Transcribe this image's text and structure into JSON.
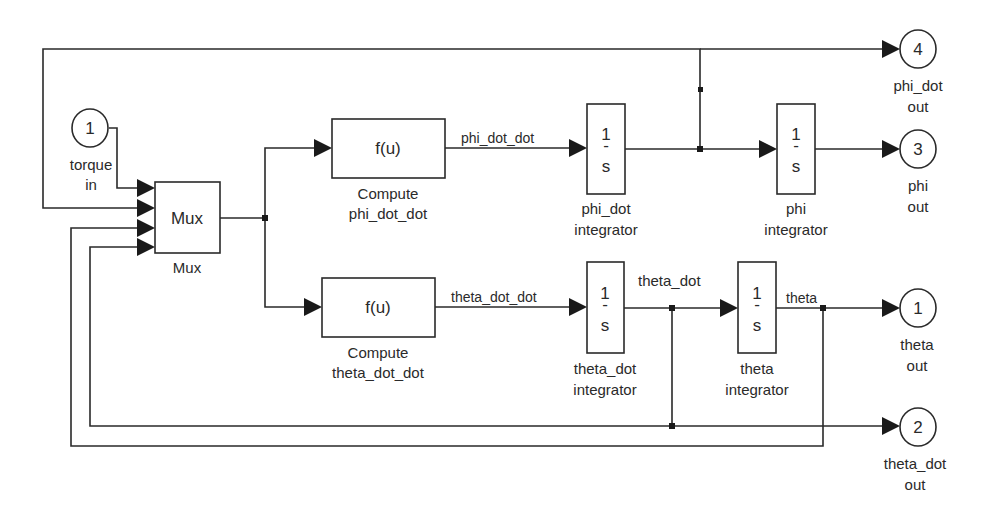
{
  "diagram": {
    "type": "simulink-block-diagram",
    "inports": [
      {
        "number": "1",
        "name_line1": "torque",
        "name_line2": "in"
      }
    ],
    "mux": {
      "label": "Mux",
      "name": "Mux",
      "inputs": 4
    },
    "fcn_blocks": {
      "phi": {
        "expr": "f(u)",
        "name_line1": "Compute",
        "name_line2": "phi_dot_dot"
      },
      "theta": {
        "expr": "f(u)",
        "name_line1": "Compute",
        "name_line2": "theta_dot_dot"
      }
    },
    "integrators": {
      "phi_dot": {
        "num": "1",
        "bar": "-",
        "den": "s",
        "name_line1": "phi_dot",
        "name_line2": "integrator"
      },
      "phi": {
        "num": "1",
        "bar": "-",
        "den": "s",
        "name_line1": "phi",
        "name_line2": "integrator"
      },
      "theta_dot": {
        "num": "1",
        "bar": "-",
        "den": "s",
        "name_line1": "theta_dot",
        "name_line2": "integrator"
      },
      "theta": {
        "num": "1",
        "bar": "-",
        "den": "s",
        "name_line1": "theta",
        "name_line2": "integrator"
      }
    },
    "signals": {
      "phi_dot_dot": "phi_dot_dot",
      "theta_dot_dot": "theta_dot_dot",
      "theta_dot": "theta_dot",
      "theta": "theta"
    },
    "outports": {
      "phi_dot": {
        "number": "4",
        "name_line1": "phi_dot",
        "name_line2": "out"
      },
      "phi": {
        "number": "3",
        "name_line1": "phi",
        "name_line2": "out"
      },
      "theta": {
        "number": "1",
        "name_line1": "theta",
        "name_line2": "out"
      },
      "theta_dot": {
        "number": "2",
        "name_line1": "theta_dot",
        "name_line2": "out"
      }
    }
  }
}
